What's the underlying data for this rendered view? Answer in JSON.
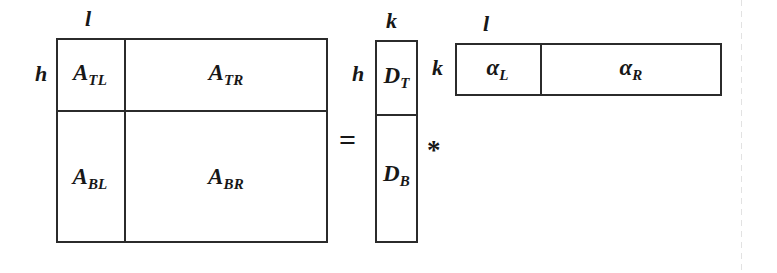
{
  "figure": {
    "type": "block-matrix-equation",
    "ink_color": "#2b2b2b",
    "background": "#ffffff"
  },
  "operators": {
    "equals": "=",
    "multiply": "*"
  },
  "matrix_a": {
    "name": "A",
    "row_dim_label": "h",
    "col_dim_label": "l",
    "blocks": [
      {
        "id": "TL",
        "base": "A",
        "sub": "TL"
      },
      {
        "id": "TR",
        "base": "A",
        "sub": "TR"
      },
      {
        "id": "BL",
        "base": "A",
        "sub": "BL"
      },
      {
        "id": "BR",
        "base": "A",
        "sub": "BR"
      }
    ]
  },
  "matrix_d": {
    "name": "D",
    "row_dim_label": "h",
    "col_dim_label": "k",
    "blocks": [
      {
        "id": "T",
        "base": "D",
        "sub": "T"
      },
      {
        "id": "B",
        "base": "D",
        "sub": "B"
      }
    ]
  },
  "matrix_alpha": {
    "name": "alpha",
    "row_dim_label": "k",
    "col_dim_label": "l",
    "blocks": [
      {
        "id": "L",
        "base": "α",
        "sub": "L"
      },
      {
        "id": "R",
        "base": "α",
        "sub": "R"
      }
    ]
  }
}
